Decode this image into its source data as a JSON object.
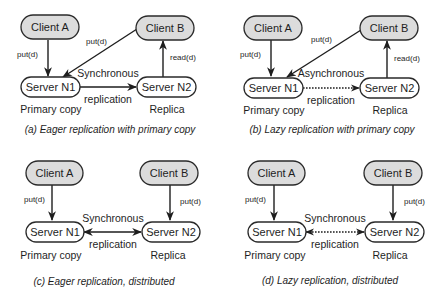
{
  "colors": {
    "client_fill": "#dcdcdc",
    "server_fill": "#ffffff",
    "stroke": "#2a2a2a",
    "text": "#1e1e1e"
  },
  "panels": [
    {
      "id": "a",
      "caption_letter": "(a)",
      "caption_text": " Eager replication with primary copy",
      "client_a": "Client A",
      "client_b": "Client B",
      "server_n1": "Server N1",
      "server_n2": "Server N2",
      "role_n1": "Primary copy",
      "role_n2": "Replica",
      "repl_top": "Synchronous",
      "repl_bottom": "replication",
      "edge_a": "put(d)",
      "edge_b": "put(d)",
      "edge_b2": "read(d)",
      "replication_style": "solid",
      "replication_direction": "one-way"
    },
    {
      "id": "b",
      "caption_letter": "(b)",
      "caption_text": " Lazy replication with primary copy",
      "client_a": "Client A",
      "client_b": "Client B",
      "server_n1": "Server N1",
      "server_n2": "Server N2",
      "role_n1": "Primary copy",
      "role_n2": "Replica",
      "repl_top": "Asynchronous",
      "repl_bottom": "replication",
      "edge_a": "put(d)",
      "edge_b": "put(d)",
      "edge_b2": "read(d)",
      "replication_style": "dotted",
      "replication_direction": "one-way"
    },
    {
      "id": "c",
      "caption_letter": "(c)",
      "caption_text": " Eager replication, distributed",
      "client_a": "Client A",
      "client_b": "Client B",
      "server_n1": "Server N1",
      "server_n2": "Server N2",
      "role_n1": "Primary copy",
      "role_n2": "Replica",
      "repl_top": "Synchronous",
      "repl_bottom": "replication",
      "edge_a": "put(d)",
      "edge_b": "put(d)",
      "replication_style": "solid",
      "replication_direction": "two-way"
    },
    {
      "id": "d",
      "caption_letter": "(d)",
      "caption_text": " Lazy replication, distributed",
      "client_a": "Client A",
      "client_b": "Client B",
      "server_n1": "Server N1",
      "server_n2": "Server N2",
      "role_n1": "Primary copy",
      "role_n2": "Replica",
      "repl_top": "Synchronous",
      "repl_bottom": "replication",
      "edge_a": "put(d)",
      "edge_b": "put(d)",
      "replication_style": "dotted",
      "replication_direction": "two-way"
    }
  ]
}
